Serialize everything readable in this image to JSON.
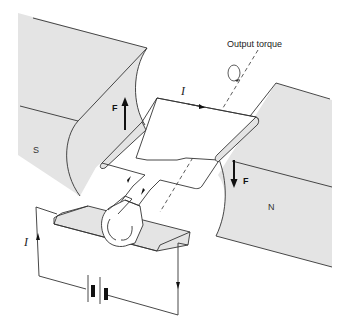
{
  "diagram": {
    "title_annotation": "Output torque",
    "poles": {
      "south_label": "S",
      "north_label": "N"
    },
    "forces": {
      "left_label": "F",
      "right_label": "F"
    },
    "current": {
      "loop_label": "I",
      "circuit_label": "I"
    },
    "components": [
      "magnet pole S",
      "magnet pole N",
      "rectangular coil loop",
      "split-ring commutator",
      "brushes",
      "battery",
      "rotation axis"
    ],
    "colors": {
      "pole_fill": "#e4e4e4",
      "line": "#333333",
      "background": "#ffffff"
    }
  }
}
